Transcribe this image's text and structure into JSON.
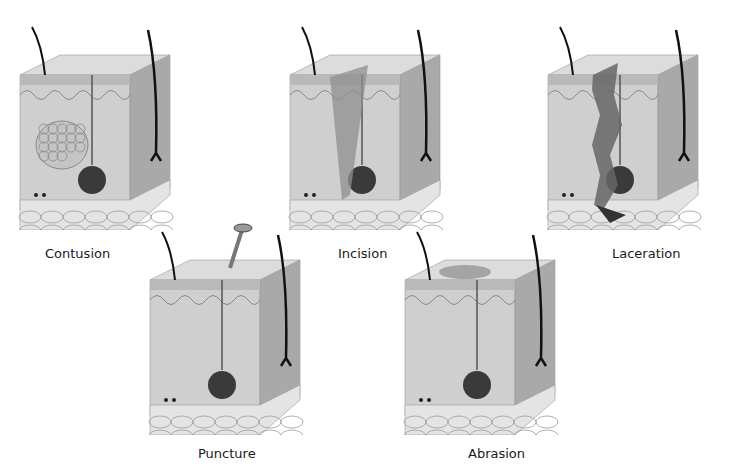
{
  "figure": {
    "panels": [
      {
        "id": "contusion",
        "label": "Contusion",
        "x": 10,
        "y": 15,
        "label_x": 45,
        "label_y": 246
      },
      {
        "id": "incision",
        "label": "Incision",
        "x": 280,
        "y": 15,
        "label_x": 338,
        "label_y": 246
      },
      {
        "id": "laceration",
        "label": "Laceration",
        "x": 538,
        "y": 15,
        "label_x": 612,
        "label_y": 246
      },
      {
        "id": "puncture",
        "label": "Puncture",
        "x": 140,
        "y": 220,
        "label_x": 198,
        "label_y": 446
      },
      {
        "id": "abrasion",
        "label": "Abrasion",
        "x": 395,
        "y": 220,
        "label_x": 468,
        "label_y": 446
      }
    ],
    "caption": {
      "text": "",
      "note": "Caption clipped at bottom edge; text not legible"
    },
    "colors": {
      "epidermis": "#b9b9b9",
      "dermis": "#cfcfcf",
      "dermis_side": "#a9a9a9",
      "fat": "#e4e4e4",
      "fat_outline": "#9a9a9a",
      "hair": "#111111",
      "gland": "#3a3a3a",
      "wound": "#555555"
    }
  }
}
